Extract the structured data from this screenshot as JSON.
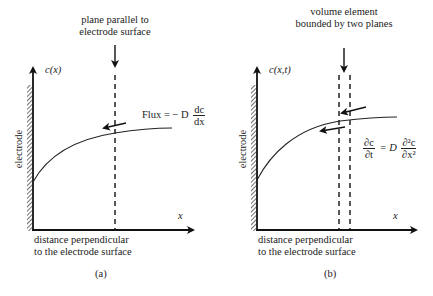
{
  "panels": [
    {
      "id": "a",
      "caption": "(a)",
      "top_label_line1": "plane parallel to",
      "top_label_line2": "electrode surface",
      "y_axis_label": "c(x)",
      "x_axis_label": "x",
      "electrode_label": "electrode",
      "bottom_label_line1": "distance perpendicular",
      "bottom_label_line2": "to the electrode surface",
      "equation": {
        "lhs": "Flux = − D",
        "num": "dc",
        "den": "dx"
      }
    },
    {
      "id": "b",
      "caption": "(b)",
      "top_label_line1": "volume element",
      "top_label_line2": "bounded by two planes",
      "y_axis_label": "c(x,t)",
      "x_axis_label": "x",
      "electrode_label": "electrode",
      "bottom_label_line1": "distance perpendicular",
      "bottom_label_line2": "to the electrode surface",
      "equation": {
        "lhs_num": "∂c",
        "lhs_den": "∂t",
        "mid": "= D",
        "rhs_num": "∂²c",
        "rhs_den": "∂x²"
      }
    }
  ]
}
